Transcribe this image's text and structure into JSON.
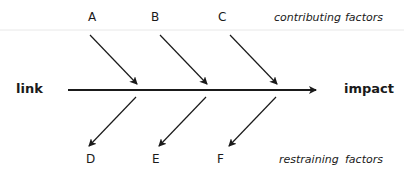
{
  "diagram": {
    "left_label": "link",
    "right_label": "impact",
    "top": {
      "factors": [
        "A",
        "B",
        "C"
      ],
      "caption_word1": "contributing",
      "caption_word2": "factors"
    },
    "bottom": {
      "factors": [
        "D",
        "E",
        "F"
      ],
      "caption_word1": "restraining",
      "caption_word2": "factors"
    },
    "colors": {
      "line": "#1a1a1a",
      "divider": "#e6e6e6",
      "text": "#1a1a1a"
    }
  }
}
